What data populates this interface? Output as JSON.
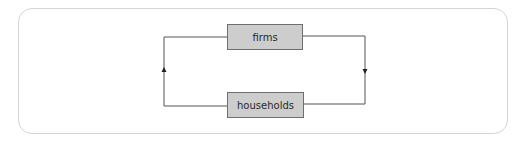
{
  "diagram": {
    "type": "circular-flow",
    "nodes": [
      {
        "id": "firms",
        "label": "firms"
      },
      {
        "id": "households",
        "label": "households"
      }
    ],
    "edges": [
      {
        "from": "firms",
        "to": "households",
        "side": "right",
        "direction": "down"
      },
      {
        "from": "households",
        "to": "firms",
        "side": "left",
        "direction": "up"
      }
    ]
  },
  "colors": {
    "node_fill": "#cdcdcd",
    "node_border": "#6e6e6e",
    "line": "#555555",
    "frame_border": "#d4d4d4"
  }
}
